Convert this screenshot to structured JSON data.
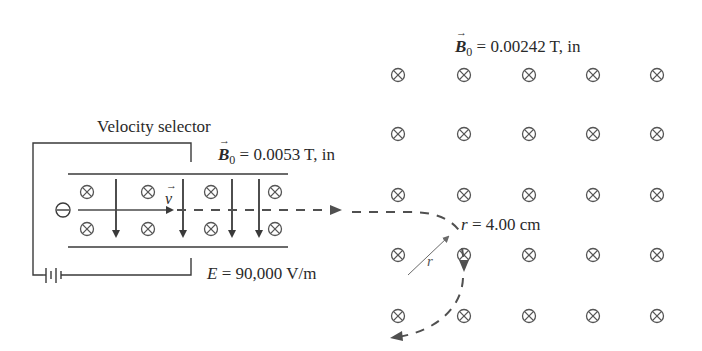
{
  "diagram": {
    "velocity_selector": {
      "label": "Velocity selector",
      "B_symbol": "B",
      "B_subscript": "0",
      "B_value": "= 0.0053 T, in",
      "E_symbol": "E",
      "E_value": "= 90,000 V/m",
      "velocity_symbol": "v",
      "particle_symbol": "⊖"
    },
    "deflection_region": {
      "B_symbol": "B",
      "B_subscript": "0",
      "B_value": "= 0.00242 T, in",
      "radius_label_symbol": "r",
      "radius_value": "= 4.00 cm",
      "radius_arrow_label": "r",
      "field_symbol": "⊗",
      "grid_columns": [
        398,
        464,
        529,
        593,
        657
      ],
      "grid_rows": [
        75,
        134,
        195,
        255,
        316
      ]
    },
    "colors": {
      "line": "#3a3a3a",
      "field_symbol": "#555555",
      "dashed_path": "#505050"
    }
  }
}
